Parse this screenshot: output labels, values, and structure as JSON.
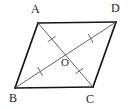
{
  "figure": {
    "shape_type": "parallelogram",
    "background_color": "#ffffff",
    "stroke_color": "#141414",
    "diagonal_color": "#555555",
    "tick_color": "#555555",
    "label_color": "#1a1a1a"
  },
  "vertices": {
    "A": {
      "label": "A",
      "x": 38,
      "y": 23
    },
    "D": {
      "label": "D",
      "x": 116,
      "y": 22
    },
    "B": {
      "label": "B",
      "x": 15,
      "y": 88
    },
    "C": {
      "label": "C",
      "x": 93,
      "y": 87
    }
  },
  "center": {
    "label": "O",
    "x": 65.5,
    "y": 55
  },
  "edges": [
    {
      "name": "AD",
      "from": "A",
      "to": "D"
    },
    {
      "name": "DC",
      "from": "D",
      "to": "C"
    },
    {
      "name": "CB",
      "from": "C",
      "to": "B"
    },
    {
      "name": "BA",
      "from": "B",
      "to": "A"
    }
  ],
  "diagonals": [
    {
      "name": "AC",
      "from": "A",
      "to": "C"
    },
    {
      "name": "BD",
      "from": "B",
      "to": "D"
    }
  ],
  "tick_marks": [
    {
      "name": "tick-AO",
      "segment": "AO",
      "x": 51.7,
      "y": 39,
      "count": 1
    },
    {
      "name": "tick-OC",
      "segment": "OC",
      "x": 79.2,
      "y": 71,
      "count": 1
    },
    {
      "name": "tick-BO",
      "segment": "BO",
      "x": 40.2,
      "y": 71.5,
      "count": 1
    },
    {
      "name": "tick-OD",
      "segment": "OD",
      "x": 90.7,
      "y": 38.5,
      "count": 1
    }
  ]
}
